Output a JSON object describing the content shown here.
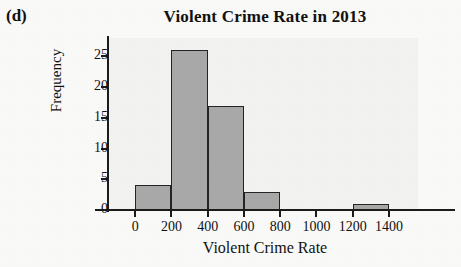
{
  "panel": {
    "label": "(d)"
  },
  "chart_data": {
    "type": "bar",
    "subtype": "histogram",
    "title": "Violent Crime Rate in 2013",
    "xlabel": "Violent Crime Rate",
    "ylabel": "Frequency",
    "bin_width": 200,
    "categories": [
      "0-200",
      "200-400",
      "400-600",
      "600-800",
      "800-1000",
      "1000-1200",
      "1200-1400"
    ],
    "bin_edges": [
      0,
      200,
      400,
      600,
      800,
      1000,
      1200,
      1400
    ],
    "values": [
      4,
      26,
      17,
      3,
      0,
      0,
      1
    ],
    "x_ticks": [
      0,
      200,
      400,
      600,
      800,
      1000,
      1200,
      1400
    ],
    "x_tick_labels": [
      "0",
      "200",
      "400",
      "600",
      "800",
      "1000",
      "1200",
      "1400"
    ],
    "y_ticks": [
      0,
      5,
      10,
      15,
      20,
      25
    ],
    "y_tick_labels": [
      "0",
      "5",
      "10",
      "15",
      "20",
      "25"
    ],
    "xlim": [
      -150,
      1560
    ],
    "ylim": [
      0,
      28
    ],
    "grid": false,
    "legend": false,
    "bar_fill_color": "#a9a9a9",
    "bar_edge_color": "#242424",
    "plot_background_color": "#f4f4f2",
    "axis_color": "#1b1b1b"
  }
}
